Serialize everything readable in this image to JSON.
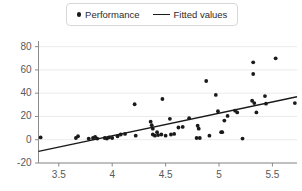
{
  "legend": {
    "position": "top-center",
    "entries": [
      {
        "label": "Performance",
        "marker": "dot-icon",
        "color": "#1a1a1a"
      },
      {
        "label": "Fitted values",
        "marker": "line-icon",
        "color": "#1a1a1a"
      }
    ]
  },
  "chart_data": {
    "type": "scatter",
    "title": "",
    "xlabel": "",
    "ylabel": "",
    "xlim": [
      3.31,
      5.73
    ],
    "ylim": [
      -20,
      84
    ],
    "xticks": [
      3.5,
      4,
      4.5,
      5,
      5.5
    ],
    "xtick_labels": [
      "3.5",
      "4",
      "4.5",
      "5",
      "5.5"
    ],
    "yticks": [
      -20,
      0,
      20,
      40,
      60,
      80
    ],
    "ytick_labels": [
      "-20",
      "0",
      "20",
      "40",
      "60",
      "80"
    ],
    "grid": "horizontal",
    "grid_color": "#ebebeb",
    "axis_color": "#8a8a8a",
    "series": [
      {
        "name": "Performance",
        "type": "scatter",
        "marker": "dot",
        "color": "#1a1a1a",
        "points": [
          [
            3.33,
            2.0
          ],
          [
            3.66,
            1.5
          ],
          [
            3.68,
            3.0
          ],
          [
            3.78,
            1.0
          ],
          [
            3.82,
            1.5
          ],
          [
            3.84,
            2.5
          ],
          [
            3.86,
            1.0
          ],
          [
            3.93,
            1.5
          ],
          [
            3.95,
            1.0
          ],
          [
            3.97,
            2.0
          ],
          [
            4.0,
            1.5
          ],
          [
            4.05,
            3.0
          ],
          [
            4.08,
            4.5
          ],
          [
            4.12,
            5.0
          ],
          [
            4.21,
            30.5
          ],
          [
            4.22,
            3.5
          ],
          [
            4.36,
            15.5
          ],
          [
            4.37,
            12.5
          ],
          [
            4.38,
            9.5
          ],
          [
            4.38,
            4.5
          ],
          [
            4.4,
            3.5
          ],
          [
            4.42,
            6.5
          ],
          [
            4.43,
            4.0
          ],
          [
            4.46,
            4.5
          ],
          [
            4.47,
            35.0
          ],
          [
            4.5,
            3.5
          ],
          [
            4.54,
            18.0
          ],
          [
            4.55,
            4.5
          ],
          [
            4.58,
            5.0
          ],
          [
            4.62,
            10.5
          ],
          [
            4.66,
            11.0
          ],
          [
            4.72,
            18.5
          ],
          [
            4.79,
            1.5
          ],
          [
            4.8,
            12.0
          ],
          [
            4.81,
            9.5
          ],
          [
            4.82,
            1.5
          ],
          [
            4.88,
            50.5
          ],
          [
            4.91,
            3.5
          ],
          [
            4.97,
            38.5
          ],
          [
            4.99,
            24.5
          ],
          [
            5.02,
            6.5
          ],
          [
            5.03,
            6.5
          ],
          [
            5.05,
            16.5
          ],
          [
            5.08,
            20.5
          ],
          [
            5.15,
            25.0
          ],
          [
            5.17,
            23.5
          ],
          [
            5.22,
            1.0
          ],
          [
            5.31,
            33.5
          ],
          [
            5.32,
            66.5
          ],
          [
            5.32,
            56.5
          ],
          [
            5.33,
            31.5
          ],
          [
            5.35,
            23.5
          ],
          [
            5.43,
            37.5
          ],
          [
            5.44,
            31.0
          ],
          [
            5.53,
            70.0
          ],
          [
            5.71,
            31.5
          ]
        ]
      },
      {
        "name": "Fitted values",
        "type": "line",
        "color": "#1a1a1a",
        "x": [
          3.31,
          5.73
        ],
        "y": [
          -10.0,
          37.0
        ]
      }
    ]
  }
}
